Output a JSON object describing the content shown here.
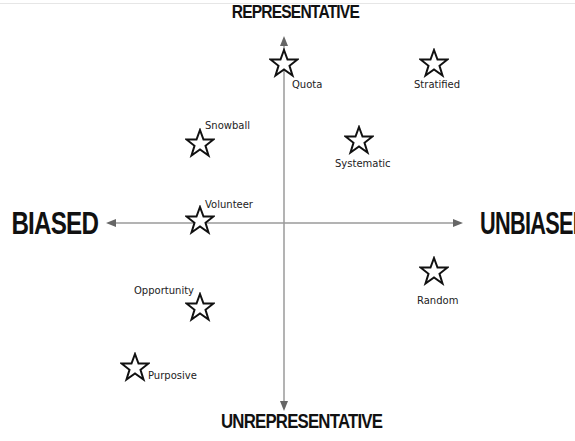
{
  "diagram": {
    "axes": {
      "top": "REPRESENTATIVE",
      "bottom": "UNREPRESENTATIVE",
      "left": "BIASED",
      "right": "UNBIASED",
      "axis_color": "#9a9a9a"
    },
    "points": [
      {
        "label": "Quota",
        "icon": "star-outline-icon",
        "x": 284,
        "y": 63,
        "label_dx": 8,
        "label_dy": 16
      },
      {
        "label": "Stratified",
        "icon": "star-outline-icon",
        "x": 434,
        "y": 63,
        "label_dx": -20,
        "label_dy": 16
      },
      {
        "label": "Snowball",
        "icon": "star-outline-icon",
        "x": 200,
        "y": 143,
        "label_dx": 5,
        "label_dy": -23
      },
      {
        "label": "Systematic",
        "icon": "star-outline-icon",
        "x": 359,
        "y": 140,
        "label_dx": -24,
        "label_dy": 18
      },
      {
        "label": "Volunteer",
        "icon": "star-outline-icon",
        "x": 200,
        "y": 220,
        "label_dx": 5,
        "label_dy": -21
      },
      {
        "label": "Random",
        "icon": "star-outline-icon",
        "x": 434,
        "y": 271,
        "label_dx": -17,
        "label_dy": 24
      },
      {
        "label": "Opportunity",
        "icon": "star-outline-icon",
        "x": 200,
        "y": 307,
        "label_dx": -66,
        "label_dy": -22
      },
      {
        "label": "Purposive",
        "icon": "star-outline-icon",
        "x": 135,
        "y": 367,
        "label_dx": 13,
        "label_dy": 3
      }
    ]
  }
}
